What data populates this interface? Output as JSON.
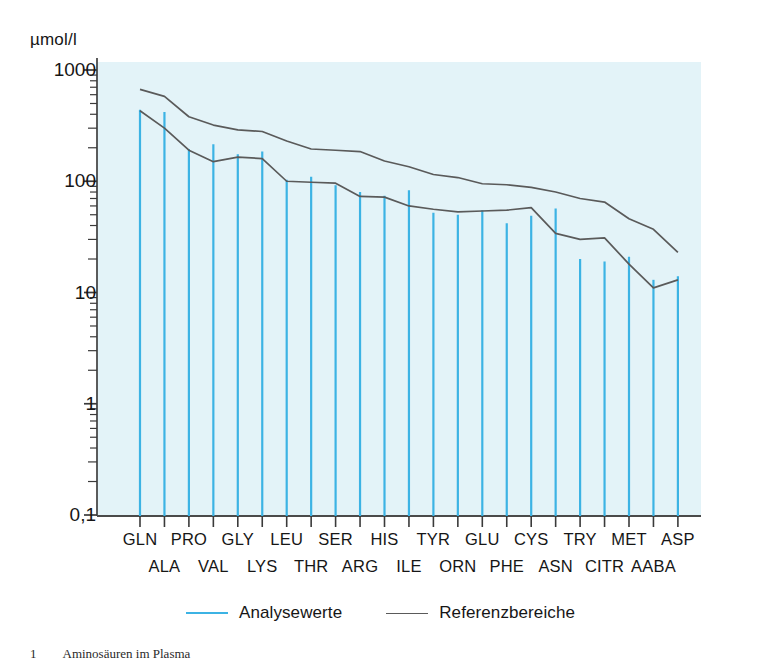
{
  "axes": {
    "y_unit_label": "µmol/l",
    "y_ticks": [
      "1000",
      "100",
      "10",
      "1",
      "0,1"
    ]
  },
  "legend": {
    "items": [
      {
        "label": "Analysewerte",
        "color": "#3cb3e4",
        "kind": "line"
      },
      {
        "label": "Referenzbereiche",
        "color": "#5a5a5a",
        "kind": "line"
      }
    ]
  },
  "caption": {
    "number": "1",
    "text": "Aminosäuren im Plasma"
  },
  "chart_data": {
    "type": "bar",
    "title": "",
    "subtitle": "",
    "xlabel": "",
    "ylabel": "µmol/l",
    "yscale": "log",
    "ylim": [
      0.1,
      1000
    ],
    "ytick_values": [
      1000,
      100,
      10,
      1,
      0.1
    ],
    "ytick_labels": [
      "1000",
      "100",
      "10",
      "1",
      "0,1"
    ],
    "grid": false,
    "legend_position": "bottom",
    "plot_bg": "#e3f3f8",
    "categories": [
      "GLN",
      "ALA",
      "PRO",
      "VAL",
      "GLY",
      "LYS",
      "LEU",
      "THR",
      "SER",
      "ARG",
      "HIS",
      "ILE",
      "TYR",
      "ORN",
      "GLU",
      "PHE",
      "CYS",
      "ASN",
      "TRY",
      "CITR",
      "MET",
      "AABA",
      "ASP"
    ],
    "category_rows": {
      "top": [
        "GLN",
        "PRO",
        "GLY",
        "LEU",
        "SER",
        "HIS",
        "TYR",
        "GLU",
        "CYS",
        "TRY",
        "MET",
        "ASP"
      ],
      "bottom": [
        "ALA",
        "VAL",
        "LYS",
        "THR",
        "ARG",
        "ILE",
        "ORN",
        "PHE",
        "ASN",
        "CITR",
        "AABA"
      ]
    },
    "series": [
      {
        "name": "Analysewerte",
        "type": "bar",
        "color": "#3cb3e4",
        "values": [
          440,
          420,
          195,
          215,
          175,
          185,
          103,
          110,
          92,
          80,
          74,
          83,
          52,
          50,
          55,
          42,
          49,
          57,
          20,
          19,
          21,
          13,
          14
        ]
      },
      {
        "name": "Referenzbereiche oben",
        "type": "line",
        "color": "#5a5a5a",
        "values": [
          670,
          580,
          380,
          320,
          290,
          280,
          230,
          195,
          190,
          185,
          152,
          135,
          115,
          108,
          95,
          93,
          88,
          80,
          70,
          65,
          46,
          37,
          23
        ]
      },
      {
        "name": "Referenzbereiche unten",
        "type": "line",
        "color": "#5a5a5a",
        "values": [
          430,
          300,
          190,
          150,
          165,
          160,
          100,
          98,
          96,
          73,
          72,
          60,
          56,
          53,
          54,
          55,
          58,
          34,
          30,
          31,
          18,
          11,
          13
        ]
      }
    ]
  }
}
